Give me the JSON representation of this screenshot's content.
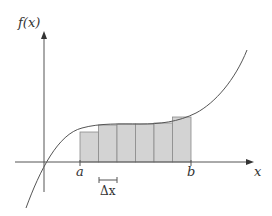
{
  "diagram": {
    "y_axis_label": "f(x)",
    "x_axis_label": "x",
    "interval_start_label": "a",
    "interval_end_label": "b",
    "width_label": "Δx",
    "num_rectangles": 6,
    "colors": {
      "rect_fill": "#d3d3d3",
      "rect_stroke": "#8a8a8a",
      "axis": "#555555",
      "curve": "#555555",
      "text": "#333333"
    },
    "rectangles": [
      {
        "x": 80,
        "top": 132
      },
      {
        "x": 98.5,
        "top": 125
      },
      {
        "x": 117,
        "top": 124
      },
      {
        "x": 135.5,
        "top": 124
      },
      {
        "x": 154,
        "top": 123
      },
      {
        "x": 172.5,
        "top": 117
      }
    ]
  }
}
